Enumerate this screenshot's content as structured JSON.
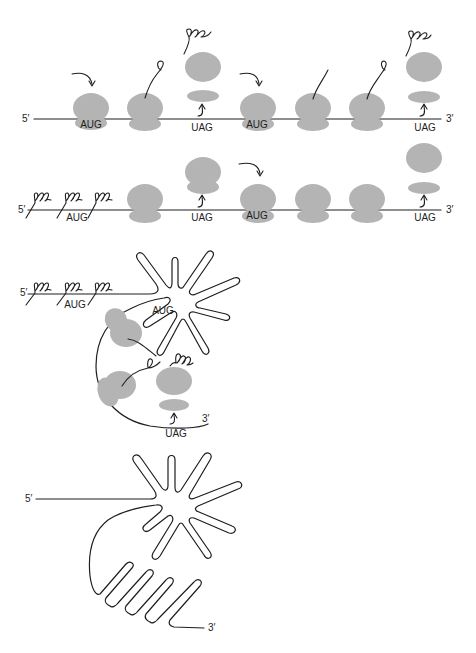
{
  "figure": {
    "colors": {
      "ribosome": "#b4b4b4",
      "line": "#1e1e1e",
      "background": "#ffffff"
    }
  },
  "panel1": {
    "five_prime": "5′",
    "three_prime": "3′",
    "codons": [
      "AUG",
      "UAG",
      "AUG",
      "UAG"
    ],
    "ribosome_states": [
      "initiating",
      "elongating-short-peptide",
      "terminating-released",
      "initiating",
      "elongating-short-peptide",
      "elongating-short-peptide",
      "terminating-released"
    ]
  },
  "panel2": {
    "five_prime": "5′",
    "three_prime": "3′",
    "codons": [
      "AUG",
      "UAG",
      "AUG",
      "UAG"
    ],
    "ribosome_states": [
      "elongating",
      "terminating",
      "initiating",
      "elongating",
      "elongating",
      "terminating-released"
    ]
  },
  "panel3": {
    "five_prime": "5′",
    "three_prime": "3′",
    "codons": [
      "AUG",
      "AUG",
      "UAG"
    ]
  },
  "panel4": {
    "five_prime": "5′",
    "three_prime": "3′"
  }
}
